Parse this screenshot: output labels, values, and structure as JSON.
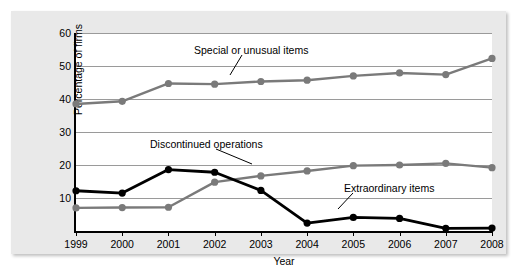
{
  "chart_data": {
    "type": "line",
    "title": "",
    "xlabel": "Year",
    "ylabel": "Percentage of firms",
    "categories": [
      "1999",
      "2000",
      "2001",
      "2002",
      "2003",
      "2004",
      "2005",
      "2006",
      "2007",
      "2008"
    ],
    "xlim": [
      1999,
      2008
    ],
    "ylim": [
      0,
      60
    ],
    "ytick_labels": [
      "60",
      "50",
      "40",
      "30",
      "20",
      "10"
    ],
    "yticks": [
      60,
      50,
      40,
      30,
      20,
      10
    ],
    "grid": true,
    "legend": "inline-annotations",
    "series": [
      {
        "name": "Special or unusual items",
        "color": "#7a7a7a",
        "values": [
          38.5,
          39.3,
          44.7,
          44.5,
          45.3,
          45.7,
          47.0,
          47.9,
          47.4,
          52.3
        ]
      },
      {
        "name": "Discontinued operations",
        "color": "#7a7a7a",
        "values": [
          7.0,
          7.1,
          7.2,
          14.8,
          16.7,
          18.2,
          19.8,
          20.0,
          20.5,
          19.2
        ]
      },
      {
        "name": "Extraordinary items",
        "color": "#000000",
        "values": [
          12.2,
          11.5,
          18.6,
          17.8,
          12.3,
          2.4,
          4.1,
          3.8,
          0.8,
          0.9
        ]
      }
    ],
    "annotations": [
      {
        "text": "Special or unusual items",
        "x": 181,
        "y": 38
      },
      {
        "text": "Discontinued operations",
        "x": 137,
        "y": 132
      },
      {
        "text": "Extraordinary items",
        "x": 331,
        "y": 176
      }
    ]
  }
}
